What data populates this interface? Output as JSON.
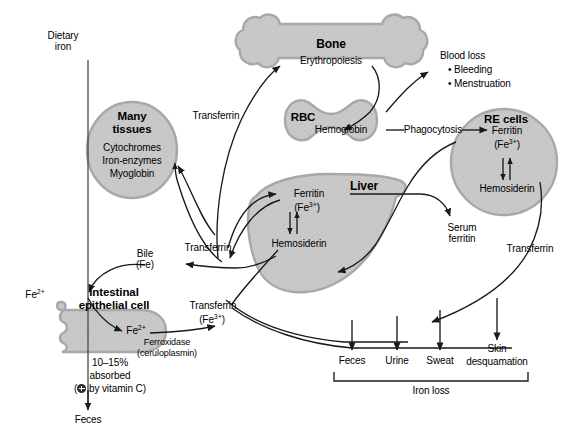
{
  "diagram": {
    "colors": {
      "organ_fill": "#c9c9c9",
      "organ_stroke": "#a8a8a8",
      "line": "#1a1a1a",
      "text": "#000000"
    }
  },
  "nodes": {
    "dietary_iron": "Dietary\niron",
    "dietary_iron_line1": "Dietary",
    "dietary_iron_line2": "iron",
    "many_tissues": {
      "title_line1": "Many",
      "title_line2": "tissues",
      "contents": [
        "Cytochromes",
        "Iron-enzymes",
        "Myoglobin"
      ]
    },
    "bone": {
      "title": "Bone",
      "process": "Erythropoiesis"
    },
    "rbc": {
      "title": "RBC",
      "contents": "Hemoglobin"
    },
    "re_cells": {
      "title": "RE cells",
      "ferritin": "Ferritin",
      "ferritin_ion_open": "(Fe",
      "ferritin_ion_sup": "3+",
      "ferritin_ion_close": ")",
      "hemosiderin": "Hemosiderin"
    },
    "liver": {
      "title": "Liver",
      "ferritin": "Ferritin",
      "ferritin_ion_open": "(Fe",
      "ferritin_ion_sup": "3+",
      "ferritin_ion_close": ")",
      "hemosiderin": "Hemosiderin"
    },
    "intestinal_cell": {
      "title_line1": "Intestinal",
      "title_line2": "epithelial cell",
      "inner_ion_text": "Fe",
      "inner_ion_sup": "2+",
      "absorbed_line1": "10–15%",
      "absorbed_line2": "absorbed",
      "absorbed_line3_pre": "(",
      "absorbed_line3_post": " by vitamin C)",
      "vitamin_c_icon": "increase-circle-icon"
    }
  },
  "labels": {
    "transferrin_to_bone": "Transferrin",
    "transferrin_hub": "Transferrin",
    "transferrin_fe3_main": "Transferrin",
    "transferrin_fe3_ion_open": "(Fe",
    "transferrin_fe3_ion_sup": "3+",
    "transferrin_fe3_ion_close": ")",
    "transferrin_right": "Transferrin",
    "phagocytosis": "Phagocytosis",
    "serum_ferritin_line1": "Serum",
    "serum_ferritin_line2": "ferritin",
    "bile_line1": "Bile",
    "bile_line2": "(Fe)",
    "ferroxidase_line1": "Ferroxidase",
    "ferroxidase_line2": "(ceruloplasmin)",
    "lumen_fe2_text": "Fe",
    "lumen_fe2_sup": "2+",
    "feces_left": "Feces"
  },
  "blood_loss": {
    "heading": "Blood loss",
    "items": [
      "• Bleeding",
      "• Menstruation"
    ]
  },
  "iron_loss": {
    "bracket_label": "Iron loss",
    "outputs": [
      {
        "label": "Feces",
        "line2": ""
      },
      {
        "label": "Urine",
        "line2": ""
      },
      {
        "label": "Sweat",
        "line2": ""
      },
      {
        "label": "Skin",
        "line2": "desquamation"
      }
    ]
  }
}
